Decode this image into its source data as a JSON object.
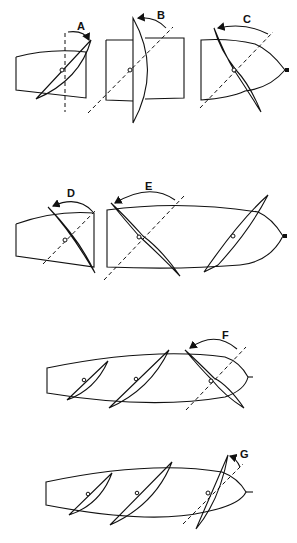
{
  "figure": {
    "type": "patent line drawing",
    "panels": [
      {
        "id": "A",
        "label": "A"
      },
      {
        "id": "B",
        "label": "B"
      },
      {
        "id": "C",
        "label": "C"
      },
      {
        "id": "D",
        "label": "D"
      },
      {
        "id": "E",
        "label": "E"
      },
      {
        "id": "F",
        "label": "F"
      },
      {
        "id": "G",
        "label": "G"
      }
    ],
    "stroke_color": "#111111",
    "background_color": "#ffffff"
  }
}
